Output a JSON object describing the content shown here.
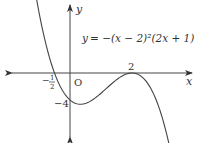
{
  "chart_data": {
    "type": "line",
    "title": "",
    "equation": "y = −(x − 2)²(2x + 1)",
    "xlabel": "x",
    "ylabel": "y",
    "origin_label": "O",
    "annotations": [
      {
        "label": "2",
        "x": 2,
        "y": 0,
        "note": "double root (tangent to x-axis)"
      },
      {
        "label": "−1/2",
        "x": -0.5,
        "y": 0,
        "note": "x-intercept"
      },
      {
        "label": "−4",
        "x": 0,
        "y": -4,
        "note": "y-intercept"
      }
    ],
    "series": [
      {
        "name": "y = −(x−2)²(2x+1)",
        "x": [
          -1.15,
          -1.0,
          -0.75,
          -0.5,
          -0.25,
          0,
          0.333,
          0.75,
          1.0,
          1.5,
          2.0,
          2.5,
          3.0,
          3.3
        ],
        "y": [
          10.2,
          9.0,
          6.1,
          0.0,
          -2.53,
          -4.0,
          -4.63,
          -3.91,
          -3.0,
          -1.0,
          0.0,
          -1.5,
          -7.0,
          -12.2
        ]
      }
    ],
    "xlim": [
      -1.3,
      3.2
    ],
    "ylim": [
      -10,
      10
    ],
    "grid": false,
    "legend": "none"
  },
  "labels": {
    "equation_lhs": "y",
    "equation_rhs": "= −(x − 2)²(2x + 1)",
    "x_axis": "x",
    "y_axis": "y",
    "origin": "O",
    "tick_2": "2",
    "tick_neg_half_num": "1",
    "tick_neg_half_den": "2",
    "tick_neg_half_sign": "−",
    "tick_neg4": "−4"
  }
}
